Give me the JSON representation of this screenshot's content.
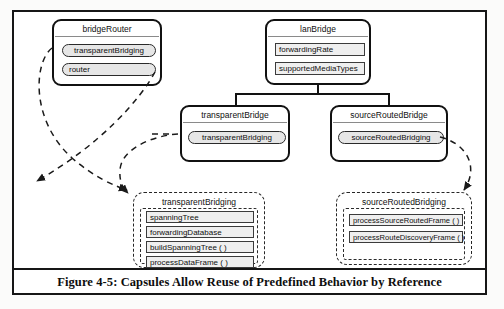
{
  "figure": {
    "caption": "Figure 4-5: Capsules Allow Reuse of Predefined Behavior by Reference"
  },
  "classes": [
    {
      "id": "bridgeRouter",
      "name": "bridgeRouter",
      "ports": [
        {
          "label": "transparentBridging"
        },
        {
          "label": "router"
        }
      ],
      "attributes": []
    },
    {
      "id": "lanBridge",
      "name": "lanBridge",
      "ports": [],
      "attributes": [
        {
          "label": "forwardingRate"
        },
        {
          "label": "supportedMediaTypes"
        }
      ]
    },
    {
      "id": "transparentBridge",
      "name": "transparentBridge",
      "ports": [
        {
          "label": "transparentBridging"
        }
      ],
      "attributes": []
    },
    {
      "id": "sourceRoutedBridge",
      "name": "sourceRoutedBridge",
      "ports": [
        {
          "label": "sourceRoutedBridging"
        }
      ],
      "attributes": []
    }
  ],
  "capsules": [
    {
      "id": "transparentBridgingCapsule",
      "name": "transparentBridging",
      "members": [
        {
          "label": "spanningTree"
        },
        {
          "label": "forwardingDatabase"
        },
        {
          "label": "buildSpanningTree ( )"
        },
        {
          "label": "processDataFrame ( )"
        }
      ]
    },
    {
      "id": "sourceRoutedBridgingCapsule",
      "name": "sourceRoutedBridging",
      "members": [
        {
          "label": "processSourceRoutedFrame ( )"
        },
        {
          "label": "processRouteDiscoveryFrame ( )"
        }
      ]
    }
  ],
  "colors": {
    "ink": "#111111",
    "port_fill": "#e6e6e6",
    "attr_fill": "#efefef",
    "divider": "#8a8a8a",
    "paper": "#ffffff"
  }
}
